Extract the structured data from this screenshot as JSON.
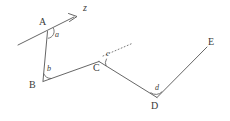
{
  "figure": {
    "stroke_color": "#555555",
    "label_color": "#3a3a3a",
    "background_color": "#ffffff",
    "width": 230,
    "height": 121
  },
  "points": [
    {
      "name": "A",
      "label": "A",
      "x": 47,
      "y": 31,
      "label_x": 40,
      "label_y": 18
    },
    {
      "name": "B",
      "label": "B",
      "x": 43,
      "y": 82,
      "label_x": 30,
      "label_y": 82
    },
    {
      "name": "C",
      "label": "C",
      "x": 99,
      "y": 62,
      "label_x": 94,
      "label_y": 64
    },
    {
      "name": "D",
      "label": "D",
      "x": 157,
      "y": 98,
      "label_x": 152,
      "label_y": 102
    },
    {
      "name": "E",
      "label": "E",
      "x": 207,
      "y": 47,
      "label_x": 210,
      "label_y": 38
    }
  ],
  "segments": [
    {
      "name": "segment-AB",
      "from": "A",
      "to": "B",
      "style": "solid"
    },
    {
      "name": "segment-BC",
      "from": "B",
      "to": "C",
      "style": "solid"
    },
    {
      "name": "segment-CD",
      "from": "C",
      "to": "D",
      "style": "solid"
    },
    {
      "name": "segment-DE",
      "from": "D",
      "to": "E",
      "style": "solid"
    }
  ],
  "rays": [
    {
      "name": "transversal-ray-z",
      "label": "z",
      "label_x": 84,
      "label_y": 4,
      "x1": 18,
      "y1": 45,
      "x2": 77,
      "y2": 16,
      "style": "solid",
      "arrowhead": true
    },
    {
      "name": "auxiliary-dotted-ray-at-C",
      "label": "",
      "x1": 103,
      "y1": 56,
      "x2": 132,
      "y2": 44,
      "style": "dotted",
      "arrowhead": false
    }
  ],
  "angles": [
    {
      "name": "angle-a",
      "label": "a",
      "vertex": "A",
      "label_x": 55,
      "label_y": 33
    },
    {
      "name": "angle-b",
      "label": "b",
      "vertex": "B",
      "label_x": 47,
      "label_y": 68
    },
    {
      "name": "angle-c",
      "label": "c",
      "vertex": "C",
      "label_x": 105,
      "label_y": 50
    },
    {
      "name": "angle-d",
      "label": "d",
      "vertex": "D",
      "label_x": 155,
      "label_y": 85
    }
  ]
}
